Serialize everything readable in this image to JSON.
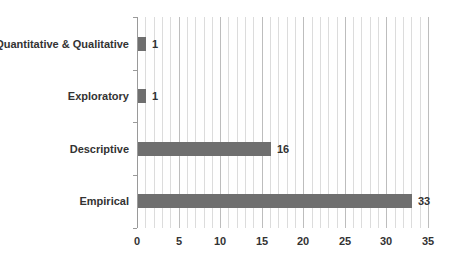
{
  "chart_data": {
    "type": "bar",
    "orientation": "horizontal",
    "title": "",
    "xlabel": "",
    "ylabel": "",
    "categories": [
      "Quantitative & Qualitative",
      "Exploratory",
      "Descriptive",
      "Empirical"
    ],
    "values": [
      1,
      1,
      16,
      33
    ],
    "data_labels": [
      "1",
      "1",
      "16",
      "33"
    ],
    "xlim": [
      0,
      35
    ],
    "x_ticks": [
      "0",
      "5",
      "10",
      "15",
      "20",
      "25",
      "30",
      "35"
    ],
    "grid": true,
    "minor_grid_step": 1,
    "legend": null,
    "bar_color": "#6f6f6f"
  }
}
